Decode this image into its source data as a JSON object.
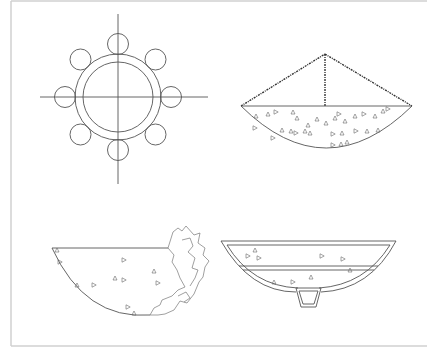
{
  "figure": {
    "title": "",
    "panels": [
      {
        "id": "top-left",
        "name": "ring-with-eight-circles",
        "description": "Concentric double ring on crosshair with 8 satellite circles"
      },
      {
        "id": "top-right",
        "name": "segment-with-pitched-roof",
        "description": "Circular segment filled with triangles, topped by a roughened triangular roof and central post"
      },
      {
        "id": "bottom-left",
        "name": "broken-half-segment",
        "description": "Half circular segment with triangle markers and irregular fractured right edge"
      },
      {
        "id": "bottom-right",
        "name": "double-walled-bowl",
        "description": "Double-walled bowl with horizontal divider, triangle markers, and trapezoidal foot"
      }
    ]
  },
  "colors": {
    "line": "#555555",
    "frame": "#d0d0d0",
    "background": "#ffffff"
  }
}
